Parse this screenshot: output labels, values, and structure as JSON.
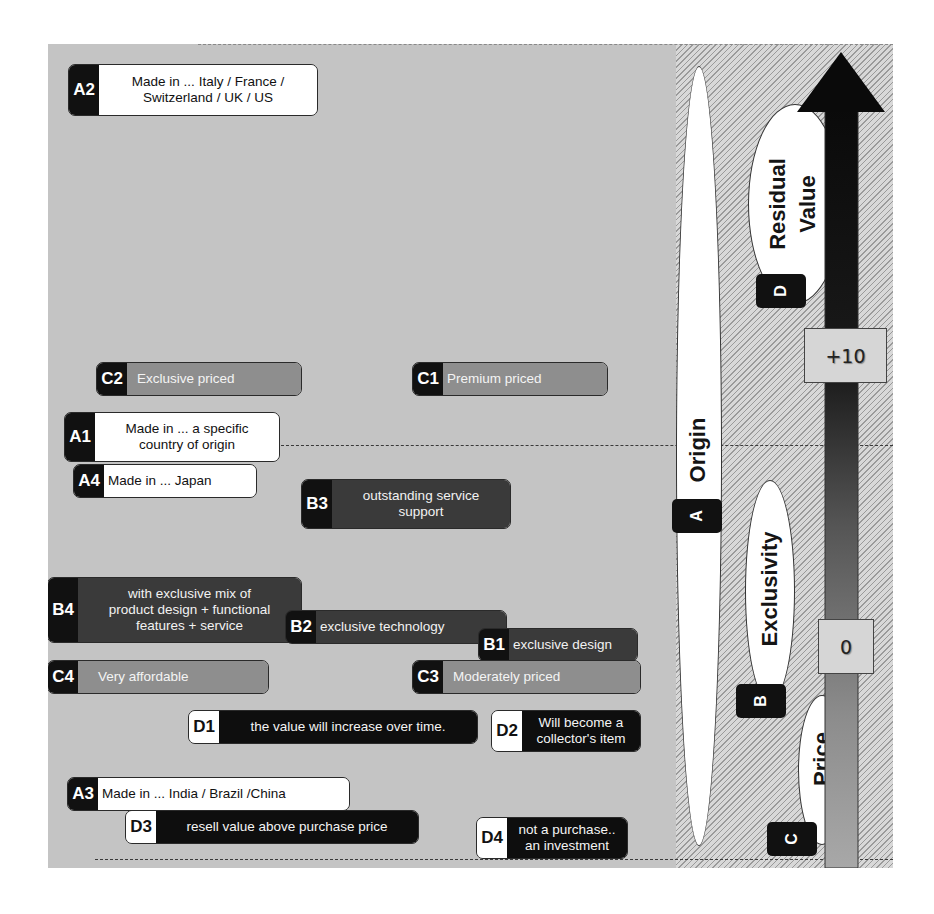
{
  "axis": {
    "dimensions": [
      {
        "code": "A",
        "label": "Origin"
      },
      {
        "code": "B",
        "label": "Exclusivity"
      },
      {
        "code": "C",
        "label": "Price"
      },
      {
        "code": "D",
        "label": "Residual\nValue"
      }
    ],
    "scale_top": "+10",
    "scale_zero": "0",
    "arrow_direction": "up"
  },
  "items": {
    "A1": {
      "code": "A1",
      "text": "Made in ... a specific\ncountry of origin"
    },
    "A2": {
      "code": "A2",
      "text": "Made in ... Italy / France /\nSwitzerland / UK / US"
    },
    "A3": {
      "code": "A3",
      "text": "Made in ... India / Brazil /China"
    },
    "A4": {
      "code": "A4",
      "text": "Made in ... Japan"
    },
    "B1": {
      "code": "B1",
      "text": "exclusive design"
    },
    "B2": {
      "code": "B2",
      "text": "exclusive technology"
    },
    "B3": {
      "code": "B3",
      "text": "outstanding service\nsupport"
    },
    "B4": {
      "code": "B4",
      "text": "with exclusive mix of\nproduct design + functional\nfeatures + service"
    },
    "C1": {
      "code": "C1",
      "text": "Premium priced"
    },
    "C2": {
      "code": "C2",
      "text": "Exclusive priced"
    },
    "C3": {
      "code": "C3",
      "text": "Moderately priced"
    },
    "C4": {
      "code": "C4",
      "text": "Very affordable"
    },
    "D1": {
      "code": "D1",
      "text": "the value will increase over time."
    },
    "D2": {
      "code": "D2",
      "text": "Will become a\ncollector's item"
    },
    "D3": {
      "code": "D3",
      "text": "resell value above purchase price"
    },
    "D4": {
      "code": "D4",
      "text": "not a purchase..\nan investment"
    }
  },
  "colors": {
    "background": "#c4c4c4",
    "origin_fill": "#ffffff",
    "exclusivity_fill": "#3a3a3a",
    "price_fill": "#8e8e8e",
    "residual_fill": "#0e0e0e",
    "arrow": "#111111"
  }
}
